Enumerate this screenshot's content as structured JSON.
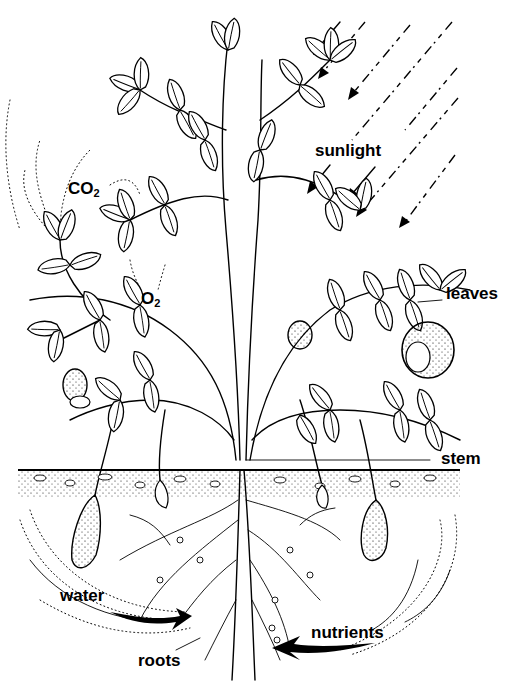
{
  "diagram": {
    "labels": {
      "sunlight": "sunlight",
      "co2_main": "CO",
      "co2_sub": "2",
      "o2_main": "O",
      "o2_sub": "2",
      "leaves": "leaves",
      "stem": "stem",
      "water": "water",
      "roots": "roots",
      "nutrients": "nutrients"
    },
    "colors": {
      "ink": "#000000",
      "background": "#ffffff"
    }
  }
}
